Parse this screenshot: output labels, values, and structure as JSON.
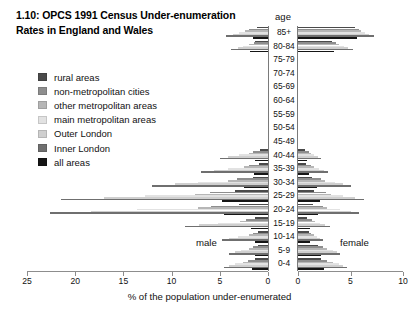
{
  "title": {
    "line1": "1.10: OPCS 1991 Census Under-enumeration",
    "line2": "Rates in England and Wales"
  },
  "legend": {
    "items": [
      {
        "label": "rural areas",
        "color": "#4a4a4a"
      },
      {
        "label": "non-metropolitan cities",
        "color": "#8e8e8e"
      },
      {
        "label": "other metropolitan areas",
        "color": "#b6b6b6"
      },
      {
        "label": "main metropolitan areas",
        "color": "#e2e2e2"
      },
      {
        "label": "Outer London",
        "color": "#cfcfcf"
      },
      {
        "label": "Inner London",
        "color": "#6f6f6f"
      },
      {
        "label": "all areas",
        "color": "#151515"
      }
    ]
  },
  "annotations": {
    "age_header": "age",
    "male": "male",
    "female": "female",
    "xlabel": "% of the population under-enumerated"
  },
  "axis": {
    "male_ticks": [
      25,
      20,
      15,
      10,
      5,
      0
    ],
    "female_ticks": [
      0,
      5,
      10
    ]
  },
  "chart_data": {
    "type": "bar",
    "title": "1.10: OPCS 1991 Census Under-enumeration Rates in England and Wales",
    "subtitle": "",
    "xlabel": "% of the population under-enumerated",
    "ylabel": "age",
    "orientation": "horizontal",
    "layout": "population-pyramid",
    "grid": false,
    "legend_position": "left",
    "male_xlim": [
      25,
      0
    ],
    "female_xlim": [
      0,
      10
    ],
    "categories": [
      "85+",
      "80-84",
      "75-79",
      "70-74",
      "65-69",
      "60-64",
      "55-59",
      "50-54",
      "45-49",
      "40-44",
      "35-39",
      "30-34",
      "25-29",
      "20-24",
      "15-19",
      "10-14",
      "5-9",
      "0-4"
    ],
    "series": [
      {
        "name": "rural areas",
        "color": "#4a4a4a",
        "male": [
          1.1,
          1.3,
          0.0,
          0.0,
          0.0,
          0.0,
          0.0,
          0.0,
          0.0,
          0.8,
          0.9,
          1.6,
          3.4,
          3.0,
          1.3,
          1.0,
          1.0,
          1.3
        ],
        "female": [
          5.4,
          3.2,
          0.0,
          0.0,
          0.0,
          0.0,
          0.0,
          0.0,
          0.0,
          0.7,
          0.8,
          1.3,
          1.5,
          1.4,
          0.9,
          1.0,
          1.9,
          2.2
        ]
      },
      {
        "name": "non-metropolitan cities",
        "color": "#8e8e8e",
        "male": [
          2.0,
          1.5,
          0.0,
          0.0,
          0.0,
          0.0,
          0.0,
          0.0,
          0.0,
          1.6,
          2.0,
          3.2,
          6.0,
          5.9,
          2.3,
          1.6,
          1.6,
          2.1
        ],
        "female": [
          5.8,
          3.6,
          0.0,
          0.0,
          0.0,
          0.0,
          0.0,
          0.0,
          0.0,
          1.0,
          1.2,
          2.2,
          2.7,
          2.4,
          1.3,
          1.2,
          2.4,
          2.8
        ]
      },
      {
        "name": "other metropolitan areas",
        "color": "#b6b6b6",
        "male": [
          2.4,
          2.0,
          0.0,
          0.0,
          0.0,
          0.0,
          0.0,
          0.0,
          0.0,
          2.0,
          2.5,
          4.1,
          7.6,
          7.3,
          2.9,
          2.0,
          2.0,
          2.6
        ],
        "female": [
          6.0,
          3.9,
          0.0,
          0.0,
          0.0,
          0.0,
          0.0,
          0.0,
          0.0,
          1.2,
          1.5,
          2.6,
          3.1,
          2.8,
          1.6,
          1.5,
          2.8,
          3.3
        ]
      },
      {
        "name": "main metropolitan areas",
        "color": "#e2e2e2",
        "male": [
          3.0,
          2.6,
          0.0,
          0.0,
          0.0,
          0.0,
          0.0,
          0.0,
          0.0,
          3.0,
          4.2,
          7.3,
          12.8,
          13.6,
          5.2,
          3.1,
          2.8,
          3.4
        ],
        "female": [
          6.4,
          4.4,
          0.0,
          0.0,
          0.0,
          0.0,
          0.0,
          0.0,
          0.0,
          1.5,
          2.0,
          3.5,
          4.3,
          4.0,
          2.1,
          1.8,
          3.3,
          3.9
        ]
      },
      {
        "name": "Outer London",
        "color": "#cfcfcf",
        "male": [
          3.6,
          3.1,
          0.0,
          0.0,
          0.0,
          0.0,
          0.0,
          0.0,
          0.0,
          4.2,
          5.6,
          9.6,
          17.0,
          18.4,
          7.2,
          4.0,
          3.4,
          4.0
        ],
        "female": [
          6.8,
          4.8,
          0.0,
          0.0,
          0.0,
          0.0,
          0.0,
          0.0,
          0.0,
          1.9,
          2.5,
          4.3,
          5.4,
          5.0,
          2.6,
          2.1,
          3.7,
          4.3
        ]
      },
      {
        "name": "Inner London",
        "color": "#6f6f6f",
        "male": [
          4.4,
          3.8,
          0.0,
          0.0,
          0.0,
          0.0,
          0.0,
          0.0,
          0.0,
          5.0,
          7.0,
          12.0,
          21.5,
          22.6,
          8.6,
          4.8,
          4.0,
          4.6
        ],
        "female": [
          7.2,
          5.2,
          0.0,
          0.0,
          0.0,
          0.0,
          0.0,
          0.0,
          0.0,
          2.2,
          2.9,
          5.0,
          6.3,
          5.8,
          3.0,
          2.4,
          4.0,
          4.7
        ]
      },
      {
        "name": "all areas",
        "color": "#151515",
        "male": [
          1.6,
          1.9,
          0.0,
          0.0,
          0.0,
          0.0,
          0.0,
          0.0,
          0.0,
          1.3,
          1.5,
          2.5,
          4.8,
          4.6,
          1.8,
          1.3,
          1.3,
          1.7
        ],
        "female": [
          5.6,
          3.4,
          0.0,
          0.0,
          0.0,
          0.0,
          0.0,
          0.0,
          0.0,
          0.9,
          1.0,
          1.8,
          2.1,
          1.9,
          1.1,
          1.1,
          2.2,
          2.5
        ]
      }
    ]
  }
}
